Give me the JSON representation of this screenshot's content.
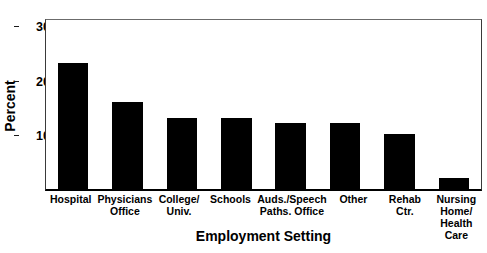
{
  "chart_data": {
    "type": "bar",
    "title": "",
    "xlabel": "Employment Setting",
    "ylabel": "Percent",
    "categories": [
      "Hospital",
      "Physicians\nOffice",
      "College/\nUniv.",
      "Schools",
      "Auds./Speech\nPaths. Office",
      "Other",
      "Rehab\nCtr.",
      "Nursing\nHome/\nHealth\nCare"
    ],
    "values": [
      23,
      16,
      13,
      13,
      12,
      12,
      10,
      2
    ],
    "ylim": [
      0,
      31.5
    ],
    "yticks": [
      10,
      20,
      30
    ],
    "ytick_labels": [
      "10",
      "20",
      "30"
    ],
    "grid": false,
    "legend": null,
    "bar_color": "#000000",
    "frame_color": "#3a3a3a",
    "background": "#ffffff"
  }
}
